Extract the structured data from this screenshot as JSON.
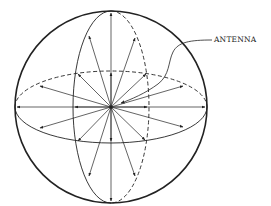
{
  "figure": {
    "type": "antenna-radiation-sphere",
    "labels": {
      "antenna": "ANTENNA"
    },
    "colors": {
      "line": "#222222",
      "background": "#ffffff"
    },
    "geometry": {
      "center": [
        111,
        107
      ],
      "sphere_radius": 96,
      "horizontal_ellipse": {
        "rx": 96,
        "ry": 36,
        "back_half": "dashed"
      },
      "vertical_ellipse": {
        "rx": 38,
        "ry": 96,
        "back_half": "dashed"
      },
      "ray_count": 16
    }
  }
}
